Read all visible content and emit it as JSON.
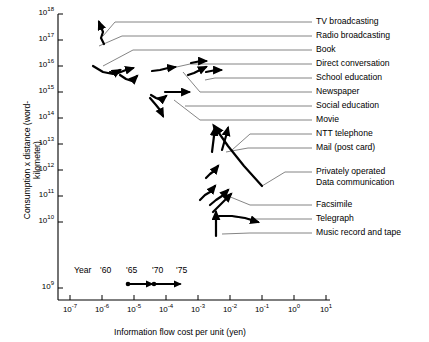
{
  "chart_data": {
    "type": "scatter",
    "title": "",
    "xlabel": "Information flow cost per unit (yen)",
    "ylabel": "Consumption x distance (word-kilometer)",
    "xscale": "log",
    "yscale": "log",
    "xlim": [
      1e-07,
      10.0
    ],
    "ylim": [
      1000000000.0,
      1e+18
    ],
    "xticks": [
      "10-7",
      "10-6",
      "10-5",
      "10-4",
      "10-3",
      "10-2",
      "10-1",
      "100",
      "101"
    ],
    "xtick_labels": [
      "10",
      "10",
      "10",
      "10",
      "10",
      "10",
      "10",
      "10",
      "10"
    ],
    "xtick_exponents": [
      "-7",
      "-6",
      "-5",
      "-4",
      "-3",
      "-2",
      "-1",
      "0",
      "1"
    ],
    "ytick_labels": [
      "10",
      "10",
      "10",
      "10",
      "10",
      "10",
      "10",
      "10",
      "10",
      "10"
    ],
    "ytick_exponents": [
      "18",
      "17",
      "16",
      "15",
      "14",
      "13",
      "12",
      "11",
      "10",
      "9"
    ],
    "grid": false,
    "legend": {
      "title": "Year",
      "years": [
        "'60",
        "'65",
        "'70",
        "'75"
      ],
      "note": "arrow scale showing trajectory direction over time"
    },
    "series": [
      {
        "name": "TV broadcasting",
        "x_log": [
          -6.05,
          -6.0,
          -5.95,
          -5.9
        ],
        "y_log": [
          17.1,
          17.35,
          17.45,
          17.62
        ]
      },
      {
        "name": "Radio broadcasting",
        "x_log": [
          -6.3,
          -6.1,
          -5.95,
          -5.8
        ],
        "y_log": [
          16.02,
          15.8,
          15.72,
          15.9
        ]
      },
      {
        "name": "Book",
        "x_log": [
          -5.7,
          -5.55,
          -5.45,
          -5.35
        ],
        "y_log": [
          15.72,
          15.75,
          15.9,
          15.95
        ]
      },
      {
        "name": "Direct conversation",
        "x_log": [
          -4.85,
          -4.7,
          -4.6,
          -4.5
        ],
        "y_log": [
          15.9,
          15.92,
          15.95,
          15.95
        ]
      },
      {
        "name": "School education",
        "x_log": [
          -3.95,
          -3.85,
          -3.8,
          -3.75
        ],
        "y_log": [
          16.1,
          16.12,
          16.15,
          16.15
        ]
      },
      {
        "name": "Newspaper",
        "x_log": [
          -3.8,
          -3.65,
          -3.5,
          -3.35
        ],
        "y_log": [
          15.62,
          15.72,
          15.8,
          15.88
        ]
      },
      {
        "name": "Social education",
        "x_log": [
          -4.7,
          -4.45,
          -4.25,
          -4.05
        ],
        "y_log": [
          15.02,
          15.05,
          15.05,
          15.05
        ]
      },
      {
        "name": "Movie",
        "x_log": [
          -4.85,
          -4.78,
          -4.72,
          -4.65
        ],
        "y_log": [
          15.2,
          15.0,
          14.8,
          14.62
        ]
      },
      {
        "name": "NTT telephone",
        "x_log": [
          -2.45,
          -2.4,
          -2.35,
          -2.3
        ],
        "y_log": [
          13.55,
          13.8,
          14.02,
          14.2
        ]
      },
      {
        "name": "Mail (post card)",
        "x_log": [
          -2.75,
          -2.7,
          -2.62,
          -2.55
        ],
        "y_log": [
          13.45,
          13.52,
          13.62,
          13.72
        ]
      },
      {
        "name": "Privately operated Data communication",
        "x_log": [
          -1.55,
          -1.8,
          -2.05,
          -2.3
        ],
        "y_log": [
          12.45,
          12.95,
          13.45,
          14.02
        ]
      },
      {
        "name": "Facsimile",
        "x_log": [
          -2.45,
          -2.4,
          -2.35,
          -2.28
        ],
        "y_log": [
          11.75,
          11.95,
          12.2,
          12.45
        ]
      },
      {
        "name": "Telegraph",
        "x_log": [
          -2.35,
          -2.2,
          -2.0,
          -1.75
        ],
        "y_log": [
          11.18,
          11.16,
          11.12,
          11.05
        ]
      },
      {
        "name": "Music record and tape",
        "x_log": [
          -2.45,
          -2.45,
          -2.45,
          -2.45
        ],
        "y_log": [
          10.7,
          10.95,
          11.15,
          11.32
        ]
      }
    ],
    "labels": [
      {
        "text": "TV broadcasting",
        "y": 22
      },
      {
        "text": "Radio broadcasting",
        "y": 36
      },
      {
        "text": "Book",
        "y": 50
      },
      {
        "text": "Direct conversation",
        "y": 64
      },
      {
        "text": "School education",
        "y": 78
      },
      {
        "text": "Newspaper",
        "y": 92
      },
      {
        "text": "Social education",
        "y": 106
      },
      {
        "text": "Movie",
        "y": 120
      },
      {
        "text": "NTT telephone",
        "y": 134
      },
      {
        "text": "Mail (post card)",
        "y": 148
      },
      {
        "text": "Privately operated",
        "y": 172
      },
      {
        "text": "Data communication",
        "y": 183
      },
      {
        "text": "Facsimile",
        "y": 205
      },
      {
        "text": "Telegraph",
        "y": 219
      },
      {
        "text": "Music record and tape",
        "y": 233
      }
    ]
  },
  "axes": {
    "y_title": "Consumption x distance (word-kilometer)",
    "x_title": "Information flow cost per unit (yen)"
  },
  "legend": {
    "year_word": "Year",
    "y60": "'60",
    "y65": "'65",
    "y70": "'70",
    "y75": "'75"
  },
  "ticks": {
    "y": [
      {
        "base": "10",
        "exp": "18"
      },
      {
        "base": "10",
        "exp": "17"
      },
      {
        "base": "10",
        "exp": "16"
      },
      {
        "base": "10",
        "exp": "15"
      },
      {
        "base": "10",
        "exp": "14"
      },
      {
        "base": "10",
        "exp": "13"
      },
      {
        "base": "10",
        "exp": "12"
      },
      {
        "base": "10",
        "exp": "11"
      },
      {
        "base": "10",
        "exp": "10"
      },
      {
        "base": "10",
        "exp": "9"
      }
    ],
    "x": [
      {
        "base": "10",
        "exp": "-7"
      },
      {
        "base": "10",
        "exp": "-6"
      },
      {
        "base": "10",
        "exp": "-5"
      },
      {
        "base": "10",
        "exp": "-4"
      },
      {
        "base": "10",
        "exp": "-3"
      },
      {
        "base": "10",
        "exp": "-2"
      },
      {
        "base": "10",
        "exp": "-1"
      },
      {
        "base": "10",
        "exp": "0"
      },
      {
        "base": "10",
        "exp": "1"
      }
    ]
  },
  "colors": {
    "ink": "#000000",
    "leader": "#555555",
    "background": "#ffffff"
  }
}
